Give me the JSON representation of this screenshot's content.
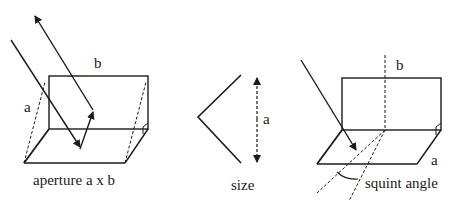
{
  "panels": [
    {
      "name": "aperture",
      "labels": {
        "b": "b",
        "a": "a",
        "caption": "aperture a x b"
      }
    },
    {
      "name": "size",
      "labels": {
        "a": "a",
        "caption": "size"
      }
    },
    {
      "name": "squint",
      "labels": {
        "b": "b",
        "a": "a",
        "caption": "squint angle"
      }
    }
  ],
  "colors": {
    "line": "#1a1a1a",
    "background": "#ffffff"
  }
}
